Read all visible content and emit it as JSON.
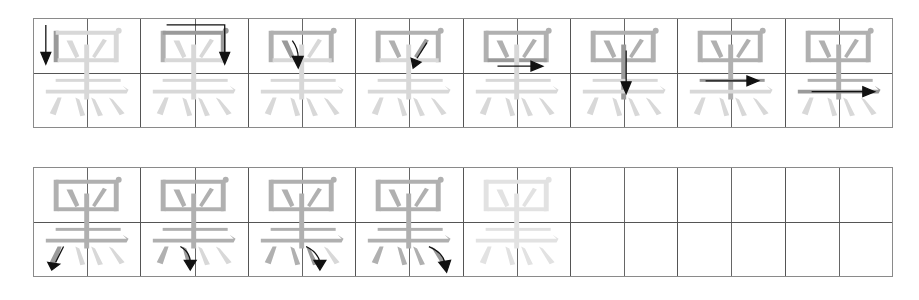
{
  "worksheet": {
    "character": "黑",
    "meaning": "black",
    "stroke_count": 12,
    "colors": {
      "grid_line": "#555555",
      "current_stroke": "#9a9a9a",
      "done_stroke": "#b0b0b0",
      "pending_stroke": "#d8d8d8",
      "trace_stroke": "#e2e2e2",
      "arrow": "#111111"
    },
    "rows": [
      {
        "cells": [
          {
            "index": 1,
            "type": "stroke",
            "stroke": 1,
            "arrow": "down-left-vertical"
          },
          {
            "index": 2,
            "type": "stroke",
            "stroke": 2,
            "arrow": "right-then-down"
          },
          {
            "index": 3,
            "type": "stroke",
            "stroke": 3,
            "arrow": "dot-down"
          },
          {
            "index": 4,
            "type": "stroke",
            "stroke": 4,
            "arrow": "dot-down-left"
          },
          {
            "index": 5,
            "type": "stroke",
            "stroke": 5,
            "arrow": "right"
          },
          {
            "index": 6,
            "type": "stroke",
            "stroke": 6,
            "arrow": "down-center"
          },
          {
            "index": 7,
            "type": "stroke",
            "stroke": 7,
            "arrow": "right"
          },
          {
            "index": 8,
            "type": "stroke",
            "stroke": 8,
            "arrow": "right-long"
          }
        ]
      },
      {
        "cells": [
          {
            "index": 9,
            "type": "stroke",
            "stroke": 9,
            "arrow": "down-left"
          },
          {
            "index": 10,
            "type": "stroke",
            "stroke": 10,
            "arrow": "curve-down-right"
          },
          {
            "index": 11,
            "type": "stroke",
            "stroke": 11,
            "arrow": "curve-down-right"
          },
          {
            "index": 12,
            "type": "stroke",
            "stroke": 12,
            "arrow": "curve-down-right"
          },
          {
            "index": 13,
            "type": "trace"
          },
          {
            "index": 14,
            "type": "empty"
          },
          {
            "index": 15,
            "type": "empty"
          },
          {
            "index": 16,
            "type": "empty"
          }
        ]
      }
    ]
  }
}
